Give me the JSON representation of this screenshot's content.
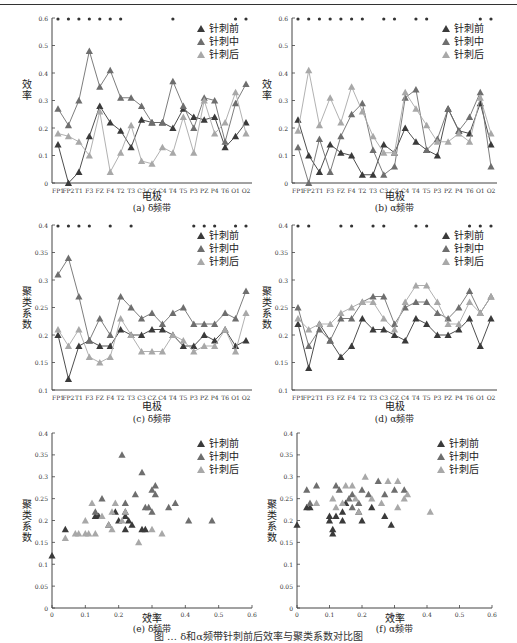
{
  "header": {
    "rule": true
  },
  "legend": [
    "针刺前",
    "针刺中",
    "针刺后"
  ],
  "colors": {
    "before": "#3a3a3a",
    "during": "#6e6e6e",
    "after": "#a8a8a8"
  },
  "figure_caption": "图 … δ和α频带针刺前后效率与聚类系数对比图",
  "chart_data": [
    {
      "id": "a",
      "type": "line",
      "title": "(a) δ频带",
      "xlabel": "电极",
      "ylabel": "效率",
      "ylim": [
        0,
        0.6
      ],
      "yticks": [
        0,
        0.1,
        0.2,
        0.3,
        0.4,
        0.5,
        0.6
      ],
      "categories": [
        "FP1",
        "FP2",
        "T1",
        "F3",
        "FZ",
        "F4",
        "T2",
        "T3",
        "C3",
        "CZ",
        "C4",
        "T4",
        "T5",
        "P3",
        "PZ",
        "P4",
        "T6",
        "O1",
        "O2"
      ],
      "significance_markers": [
        "FP1",
        "FP2",
        "T1",
        "F3",
        "F3b",
        "F4",
        "T2",
        "T5",
        "O1",
        "O2"
      ],
      "series": [
        {
          "name": "针刺前",
          "values": [
            0.14,
            0.0,
            0.04,
            0.17,
            0.28,
            0.22,
            0.19,
            0.13,
            0.23,
            0.22,
            0.22,
            0.2,
            0.27,
            0.24,
            0.23,
            0.24,
            0.13,
            0.17,
            0.22
          ]
        },
        {
          "name": "针刺中",
          "values": [
            0.27,
            0.21,
            0.3,
            0.48,
            0.35,
            0.41,
            0.31,
            0.31,
            0.28,
            0.22,
            0.22,
            0.37,
            0.28,
            0.2,
            0.31,
            0.3,
            0.15,
            0.29,
            0.36
          ]
        },
        {
          "name": "针刺后",
          "values": [
            0.18,
            0.17,
            0.15,
            0.1,
            0.26,
            0.04,
            0.11,
            0.21,
            0.08,
            0.07,
            0.13,
            0.11,
            0.24,
            0.11,
            0.3,
            0.18,
            0.22,
            0.33,
            0.18
          ]
        }
      ]
    },
    {
      "id": "b",
      "type": "line",
      "title": "(b) α频带",
      "xlabel": "电极",
      "ylabel": "效率",
      "ylim": [
        0,
        0.6
      ],
      "yticks": [
        0,
        0.1,
        0.2,
        0.3,
        0.4,
        0.5,
        0.6
      ],
      "categories": [
        "FP1",
        "FP2",
        "T1",
        "F3",
        "FZ",
        "F4",
        "T2",
        "T3",
        "C3",
        "CZ",
        "C4",
        "T4",
        "T5",
        "P3",
        "PZ",
        "P4",
        "T6",
        "O1",
        "O2"
      ],
      "series": [
        {
          "name": "针刺前",
          "values": [
            0.23,
            0.1,
            0.04,
            0.14,
            0.11,
            0.1,
            0.03,
            0.03,
            0.14,
            0.11,
            0.2,
            0.15,
            0.12,
            0.1,
            0.27,
            0.19,
            0.18,
            0.29,
            0.14
          ]
        },
        {
          "name": "针刺中",
          "values": [
            0.13,
            0.0,
            0.16,
            0.04,
            0.17,
            0.25,
            0.29,
            0.12,
            0.03,
            0.06,
            0.31,
            0.34,
            0.12,
            0.16,
            0.27,
            0.19,
            0.24,
            0.33,
            0.06
          ]
        },
        {
          "name": "针刺后",
          "values": [
            0.19,
            0.41,
            0.21,
            0.31,
            0.22,
            0.35,
            0.26,
            0.17,
            0.11,
            0.11,
            0.33,
            0.27,
            0.21,
            0.15,
            0.15,
            0.18,
            0.15,
            0.31,
            0.18
          ]
        }
      ]
    },
    {
      "id": "c",
      "type": "line",
      "title": "(c) δ频带",
      "xlabel": "电极",
      "ylabel": "聚类系数",
      "ylim": [
        0.1,
        0.4
      ],
      "yticks": [
        0.1,
        0.15,
        0.2,
        0.25,
        0.3,
        0.35,
        0.4
      ],
      "categories": [
        "FP1",
        "FP2",
        "T1",
        "F3",
        "FZ",
        "F4",
        "T2",
        "T3",
        "C3",
        "CZ",
        "C4",
        "T4",
        "T5",
        "P3",
        "PZ",
        "P4",
        "T6",
        "O1",
        "O2"
      ],
      "series": [
        {
          "name": "针刺前",
          "values": [
            0.2,
            0.12,
            0.18,
            0.19,
            0.18,
            0.18,
            0.21,
            0.2,
            0.2,
            0.21,
            0.21,
            0.2,
            0.18,
            0.18,
            0.2,
            0.19,
            0.21,
            0.18,
            0.19
          ]
        },
        {
          "name": "针刺中",
          "values": [
            0.31,
            0.34,
            0.27,
            0.19,
            0.23,
            0.2,
            0.27,
            0.25,
            0.23,
            0.24,
            0.22,
            0.24,
            0.25,
            0.22,
            0.22,
            0.22,
            0.24,
            0.23,
            0.28
          ]
        },
        {
          "name": "针刺后",
          "values": [
            0.21,
            0.18,
            0.21,
            0.16,
            0.15,
            0.16,
            0.23,
            0.2,
            0.17,
            0.17,
            0.17,
            0.2,
            0.19,
            0.17,
            0.18,
            0.18,
            0.21,
            0.17,
            0.24
          ]
        }
      ]
    },
    {
      "id": "d",
      "type": "line",
      "title": "(d) α频带",
      "xlabel": "电极",
      "ylabel": "聚类系数",
      "ylim": [
        0.1,
        0.4
      ],
      "yticks": [
        0.1,
        0.15,
        0.2,
        0.25,
        0.3,
        0.35,
        0.4
      ],
      "categories": [
        "FP1",
        "FP2",
        "T1",
        "F3",
        "FZ",
        "F4",
        "T2",
        "T3",
        "C3",
        "CZ",
        "C4",
        "T4",
        "T5",
        "P3",
        "PZ",
        "P4",
        "T6",
        "O1",
        "O2"
      ],
      "series": [
        {
          "name": "针刺前",
          "values": [
            0.22,
            0.14,
            0.22,
            0.19,
            0.16,
            0.18,
            0.23,
            0.21,
            0.21,
            0.2,
            0.19,
            0.23,
            0.22,
            0.2,
            0.2,
            0.21,
            0.23,
            0.18,
            0.23
          ]
        },
        {
          "name": "针刺中",
          "values": [
            0.25,
            0.18,
            0.21,
            0.19,
            0.23,
            0.23,
            0.26,
            0.27,
            0.27,
            0.22,
            0.25,
            0.26,
            0.26,
            0.24,
            0.23,
            0.25,
            0.28,
            0.24,
            0.27
          ]
        },
        {
          "name": "针刺后",
          "values": [
            0.23,
            0.21,
            0.22,
            0.22,
            0.24,
            0.25,
            0.26,
            0.26,
            0.23,
            0.21,
            0.26,
            0.29,
            0.29,
            0.26,
            0.22,
            0.22,
            0.26,
            0.24,
            0.27
          ]
        }
      ]
    },
    {
      "id": "e",
      "type": "scatter",
      "title": "(e) δ频带",
      "xlabel": "效率",
      "ylabel": "聚类系数",
      "xlim": [
        0,
        0.6
      ],
      "ylim": [
        0,
        0.4
      ],
      "xticks": [
        0,
        0.1,
        0.2,
        0.3,
        0.4,
        0.5,
        0.6
      ],
      "yticks": [
        0,
        0.05,
        0.1,
        0.15,
        0.2,
        0.25,
        0.3,
        0.35,
        0.4
      ],
      "series": [
        {
          "name": "针刺前",
          "points": [
            [
              0.0,
              0.12
            ],
            [
              0.04,
              0.18
            ],
            [
              0.13,
              0.21
            ],
            [
              0.14,
              0.21
            ],
            [
              0.17,
              0.19
            ],
            [
              0.19,
              0.22
            ],
            [
              0.22,
              0.21
            ],
            [
              0.22,
              0.18
            ],
            [
              0.23,
              0.2
            ],
            [
              0.24,
              0.19
            ],
            [
              0.27,
              0.18
            ],
            [
              0.28,
              0.18
            ],
            [
              0.2,
              0.2
            ],
            [
              0.22,
              0.22
            ]
          ]
        },
        {
          "name": "针刺中",
          "points": [
            [
              0.15,
              0.25
            ],
            [
              0.21,
              0.35
            ],
            [
              0.27,
              0.31
            ],
            [
              0.31,
              0.28
            ],
            [
              0.3,
              0.27
            ],
            [
              0.31,
              0.26
            ],
            [
              0.22,
              0.24
            ],
            [
              0.25,
              0.26
            ],
            [
              0.29,
              0.23
            ],
            [
              0.3,
              0.22
            ],
            [
              0.35,
              0.23
            ],
            [
              0.37,
              0.24
            ],
            [
              0.41,
              0.2
            ],
            [
              0.48,
              0.2
            ],
            [
              0.28,
              0.23
            ],
            [
              0.13,
              0.22
            ]
          ]
        },
        {
          "name": "针刺后",
          "points": [
            [
              0.04,
              0.16
            ],
            [
              0.07,
              0.17
            ],
            [
              0.08,
              0.17
            ],
            [
              0.1,
              0.17
            ],
            [
              0.11,
              0.17
            ],
            [
              0.13,
              0.17
            ],
            [
              0.1,
              0.2
            ],
            [
              0.12,
              0.24
            ],
            [
              0.18,
              0.18
            ],
            [
              0.17,
              0.19
            ],
            [
              0.18,
              0.22
            ],
            [
              0.19,
              0.24
            ],
            [
              0.21,
              0.2
            ],
            [
              0.26,
              0.15
            ],
            [
              0.3,
              0.18
            ],
            [
              0.33,
              0.17
            ],
            [
              0.22,
              0.22
            ],
            [
              0.15,
              0.21
            ]
          ]
        }
      ]
    },
    {
      "id": "f",
      "type": "scatter",
      "title": "(f) α频带",
      "xlabel": "效率",
      "ylabel": "聚类系数",
      "xlim": [
        0,
        0.6
      ],
      "ylim": [
        0,
        0.4
      ],
      "xticks": [
        0,
        0.1,
        0.2,
        0.3,
        0.4,
        0.5,
        0.6
      ],
      "yticks": [
        0,
        0.05,
        0.1,
        0.15,
        0.2,
        0.25,
        0.3,
        0.35,
        0.4
      ],
      "series": [
        {
          "name": "针刺前",
          "points": [
            [
              0.0,
              0.19
            ],
            [
              0.1,
              0.21
            ],
            [
              0.1,
              0.2
            ],
            [
              0.11,
              0.17
            ],
            [
              0.11,
              0.18
            ],
            [
              0.12,
              0.21
            ],
            [
              0.14,
              0.2
            ],
            [
              0.14,
              0.22
            ],
            [
              0.15,
              0.24
            ],
            [
              0.19,
              0.22
            ],
            [
              0.2,
              0.2
            ],
            [
              0.23,
              0.23
            ],
            [
              0.27,
              0.21
            ],
            [
              0.29,
              0.19
            ],
            [
              0.03,
              0.23
            ],
            [
              0.04,
              0.23
            ]
          ]
        },
        {
          "name": "针刺中",
          "points": [
            [
              0.03,
              0.27
            ],
            [
              0.06,
              0.28
            ],
            [
              0.04,
              0.24
            ],
            [
              0.12,
              0.28
            ],
            [
              0.13,
              0.27
            ],
            [
              0.16,
              0.25
            ],
            [
              0.17,
              0.26
            ],
            [
              0.2,
              0.27
            ],
            [
              0.22,
              0.26
            ],
            [
              0.25,
              0.29
            ],
            [
              0.27,
              0.26
            ],
            [
              0.3,
              0.27
            ],
            [
              0.33,
              0.27
            ],
            [
              0.19,
              0.24
            ],
            [
              0.17,
              0.23
            ]
          ]
        },
        {
          "name": "针刺后",
          "points": [
            [
              0.06,
              0.24
            ],
            [
              0.11,
              0.25
            ],
            [
              0.12,
              0.23
            ],
            [
              0.14,
              0.24
            ],
            [
              0.15,
              0.28
            ],
            [
              0.17,
              0.28
            ],
            [
              0.18,
              0.25
            ],
            [
              0.21,
              0.3
            ],
            [
              0.23,
              0.25
            ],
            [
              0.26,
              0.24
            ],
            [
              0.28,
              0.29
            ],
            [
              0.31,
              0.29
            ],
            [
              0.33,
              0.25
            ],
            [
              0.34,
              0.26
            ],
            [
              0.31,
              0.23
            ],
            [
              0.41,
              0.22
            ],
            [
              0.19,
              0.22
            ]
          ]
        }
      ]
    }
  ]
}
